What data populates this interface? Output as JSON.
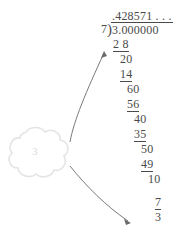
{
  "figure": {
    "name": "long-division-worksheet",
    "ink_color": "#4a4a4a",
    "callout_color": "#e6e6e6",
    "background": "#ffffff"
  },
  "division": {
    "quotient": ".428571 . . .",
    "divisor": "7",
    "bracket": ")",
    "dividend": "3.000000",
    "steps": [
      {
        "text": "2 8",
        "left": 113,
        "top": 38,
        "underlined": true
      },
      {
        "text": "20",
        "left": 120,
        "top": 53,
        "underlined": false
      },
      {
        "text": "14",
        "left": 120,
        "top": 68,
        "underlined": true
      },
      {
        "text": "60",
        "left": 127,
        "top": 83,
        "underlined": false
      },
      {
        "text": "56",
        "left": 127,
        "top": 98,
        "underlined": true
      },
      {
        "text": "40",
        "left": 134,
        "top": 113,
        "underlined": false
      },
      {
        "text": "35",
        "left": 134,
        "top": 128,
        "underlined": true
      },
      {
        "text": "50",
        "left": 141,
        "top": 143,
        "underlined": false
      },
      {
        "text": "49",
        "left": 141,
        "top": 158,
        "underlined": true
      },
      {
        "text": "10",
        "left": 148,
        "top": 173,
        "underlined": false
      },
      {
        "text": "7",
        "left": 155,
        "top": 196,
        "underlined": true
      },
      {
        "text": "3",
        "left": 155,
        "top": 211,
        "underlined": false
      }
    ]
  },
  "callout": {
    "label": "3",
    "shape": "cloud-flower",
    "arrows": [
      {
        "name": "arrow-to-first-subtraction",
        "target": "2 8"
      },
      {
        "name": "arrow-to-remainder",
        "target": "3"
      }
    ]
  }
}
